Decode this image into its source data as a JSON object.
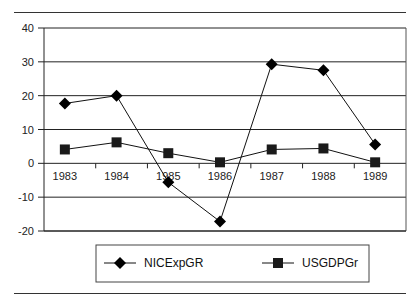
{
  "chart_data": {
    "type": "line",
    "title": "",
    "xlabel": "",
    "ylabel": "",
    "categories": [
      "1983",
      "1984",
      "1985",
      "1986",
      "1987",
      "1988",
      "1989"
    ],
    "series": [
      {
        "name": "NICExpGR",
        "marker": "diamond",
        "values": [
          17.7,
          20.0,
          -5.6,
          -17.2,
          29.3,
          27.5,
          5.6
        ]
      },
      {
        "name": "USGDPGr",
        "marker": "square",
        "values": [
          4.1,
          6.2,
          3.0,
          0.3,
          4.1,
          4.4,
          0.3
        ]
      }
    ],
    "ylim": [
      -20,
      40
    ],
    "yticks": [
      40,
      30,
      20,
      10,
      0,
      -10,
      -20
    ],
    "grid": true,
    "legend_position": "bottom",
    "colors": {
      "line": "#111111",
      "grid": "#222222",
      "marker": "#000000"
    }
  }
}
